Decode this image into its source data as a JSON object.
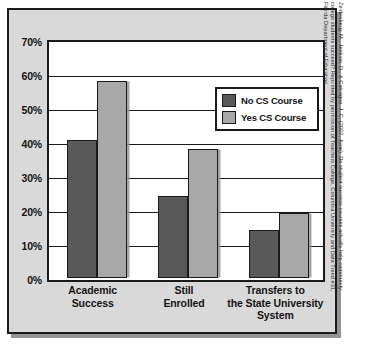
{
  "chart_data": {
    "type": "bar",
    "title": "",
    "subtitle": "",
    "xlabel": "",
    "ylabel": "",
    "ylim": [
      0,
      70
    ],
    "ytick_step": 10,
    "grid": true,
    "legend_position": "top-right-inside",
    "categories": [
      "Academic\nSuccess",
      "Still\nEnrolled",
      "Transfers to\nthe State University\nSystem"
    ],
    "series": [
      {
        "name": "No CS Course",
        "color": "#595959",
        "values": [
          40.5,
          24.0,
          14.0
        ]
      },
      {
        "name": "Yes CS Course",
        "color": "#a8a8a8",
        "values": [
          58.0,
          38.0,
          19.0
        ]
      }
    ],
    "ytick_labels": [
      "70%",
      "60%",
      "50%",
      "40%",
      "30%",
      "20%",
      "10%",
      "0%"
    ],
    "ytick_values": [
      70,
      60,
      50,
      40,
      30,
      20,
      10,
      0
    ]
  },
  "axis": {
    "y_ticks": [
      {
        "label": "70%",
        "value": 70
      },
      {
        "label": "60%",
        "value": 60
      },
      {
        "label": "50%",
        "value": 50
      },
      {
        "label": "40%",
        "value": 40
      },
      {
        "label": "30%",
        "value": 30
      },
      {
        "label": "20%",
        "value": 20
      },
      {
        "label": "10%",
        "value": 10
      },
      {
        "label": "0%",
        "value": 0
      }
    ]
  },
  "categories": [
    {
      "line1": "Academic",
      "line2": "Success",
      "line3": ""
    },
    {
      "line1": "Still",
      "line2": "Enrolled",
      "line3": ""
    },
    {
      "line1": "Transfers to",
      "line2": "the State University",
      "line3": "System"
    }
  ],
  "legend": {
    "items": [
      {
        "label": "No CS Course",
        "color": "#595959"
      },
      {
        "label": "Yes CS Course",
        "color": "#a8a8a8"
      }
    ]
  },
  "citation": {
    "line1": "Zeidenberg, M., Jenkins, D., & Calcagno, J. C. (2007, June). Do student success courses actually help community",
    "line2": "college students succeed? Reprinted by permission of Teachers College, Columbia University and Data Trend #31,",
    "line3": "Florida Department of Education"
  },
  "colors": {
    "panel_background": "#d9d9d9",
    "plot_background": "#ffffff",
    "border": "#1a1a1a",
    "series_no_cs": "#595959",
    "series_yes_cs": "#a8a8a8"
  }
}
